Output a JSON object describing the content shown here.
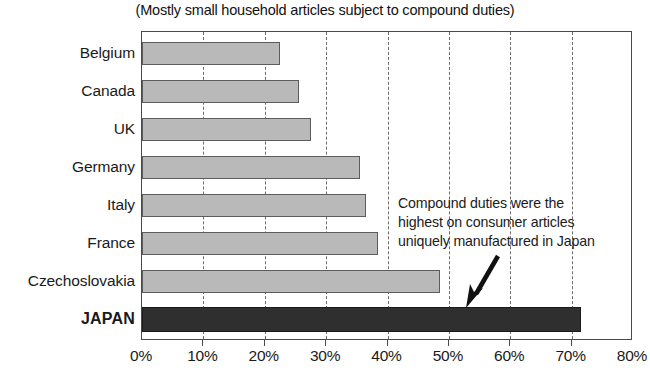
{
  "subtitle": "(Mostly small household articles subject to compound duties)",
  "annotation": {
    "line1": "Compound duties were the",
    "line2": "highest on consumer articles",
    "line3": "uniquely manufactured in Japan",
    "arrow_icon": "arrow-down-left-icon"
  },
  "axis": {
    "x_ticks": [
      "0%",
      "10%",
      "20%",
      "30%",
      "40%",
      "50%",
      "60%",
      "70%",
      "80%"
    ]
  },
  "colors": {
    "bar_fill": "#b9b9b9",
    "bar_stroke": "#5c5c5c",
    "highlight_fill": "#2f2f2f",
    "frame": "#4a4a4a",
    "gridline": "#6b6b6b",
    "text": "#1a1a1a"
  },
  "chart_data": {
    "type": "bar",
    "orientation": "horizontal",
    "title": "",
    "subtitle": "(Mostly small household articles subject to compound duties)",
    "xlabel": "",
    "ylabel": "",
    "xlim": [
      0,
      80
    ],
    "xtick_step": 10,
    "xtick_labels": [
      "0%",
      "10%",
      "20%",
      "30%",
      "40%",
      "50%",
      "60%",
      "70%",
      "80%"
    ],
    "grid": "vertical-dashed",
    "legend": "none",
    "categories": [
      "Belgium",
      "Canada",
      "UK",
      "Germany",
      "Italy",
      "France",
      "Czechoslovakia",
      "JAPAN"
    ],
    "values": [
      22.5,
      25.5,
      27.5,
      35.5,
      36.5,
      38.5,
      48.5,
      71.5
    ],
    "units": "percent",
    "highlight_category": "JAPAN",
    "annotations": [
      {
        "text": "Compound duties were the highest on consumer articles uniquely manufactured in Japan",
        "points_to": "JAPAN"
      }
    ]
  },
  "bars": [
    {
      "label": "Belgium",
      "value": 22.5,
      "bold": false,
      "highlight": false
    },
    {
      "label": "Canada",
      "value": 25.5,
      "bold": false,
      "highlight": false
    },
    {
      "label": "UK",
      "value": 27.5,
      "bold": false,
      "highlight": false
    },
    {
      "label": "Germany",
      "value": 35.5,
      "bold": false,
      "highlight": false
    },
    {
      "label": "Italy",
      "value": 36.5,
      "bold": false,
      "highlight": false
    },
    {
      "label": "France",
      "value": 38.5,
      "bold": false,
      "highlight": false
    },
    {
      "label": "Czechoslovakia",
      "value": 48.5,
      "bold": false,
      "highlight": false
    },
    {
      "label": "JAPAN",
      "value": 71.5,
      "bold": true,
      "highlight": true
    }
  ]
}
